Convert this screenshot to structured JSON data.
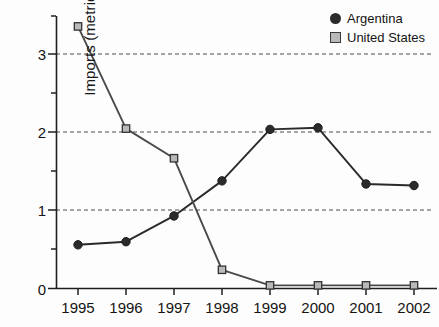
{
  "chart_data": {
    "type": "line",
    "title": "",
    "xlabel": "",
    "ylabel": "Imports (metric tons)",
    "categories": [
      "1995",
      "1996",
      "1997",
      "1998",
      "1999",
      "2000",
      "2001",
      "2002"
    ],
    "series": [
      {
        "name": "Argentina",
        "marker": "circle",
        "color": "#2b2b2b",
        "values": [
          0.56,
          0.6,
          0.93,
          1.38,
          2.04,
          2.06,
          1.34,
          1.32
        ]
      },
      {
        "name": "United States",
        "marker": "square",
        "color": "#b9b9b9",
        "values": [
          3.36,
          2.05,
          1.67,
          0.24,
          0.04,
          0.04,
          0.04,
          0.04
        ]
      }
    ],
    "ylim": [
      0,
      3.6
    ],
    "yticks": [
      0,
      1,
      2,
      3
    ],
    "ytick_labels": [
      "0",
      "1",
      "2",
      "3"
    ],
    "yminor_ticks": [
      0.5,
      1.5,
      2.5
    ],
    "gridlines": [
      1,
      2,
      3
    ],
    "grid": true,
    "grid_style": "dashed",
    "legend_position": "top-right"
  },
  "legend": {
    "items": [
      {
        "label": "Argentina",
        "marker": "circle-marker"
      },
      {
        "label": "United States",
        "marker": "square-marker"
      }
    ]
  },
  "colors": {
    "argentina_line": "#2a2a2a",
    "us_line": "#4a4a4a",
    "us_marker_fill": "#b9b9b9",
    "axis": "#1f1f1f",
    "grid": "#4d4d4d",
    "background": "#fdfdfd"
  }
}
